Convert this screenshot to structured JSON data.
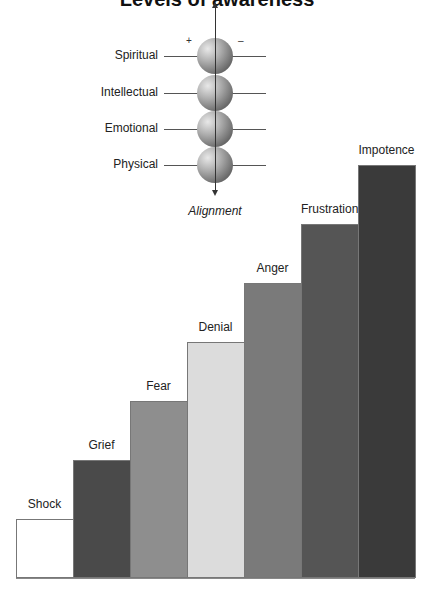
{
  "title": "Levels of awareness",
  "diagram": {
    "plus_sign": "+",
    "minus_sign": "–",
    "axis_label": "Alignment",
    "levels": [
      {
        "label": "Spiritual",
        "y": 56
      },
      {
        "label": "Intellectual",
        "y": 93
      },
      {
        "label": "Emotional",
        "y": 129
      },
      {
        "label": "Physical",
        "y": 165
      }
    ]
  },
  "chart_data": {
    "type": "bar",
    "title": "",
    "categories": [
      "Shock",
      "Grief",
      "Fear",
      "Denial",
      "Anger",
      "Frustration",
      "Impotence"
    ],
    "values": [
      1,
      2,
      3,
      4,
      5,
      6,
      7
    ],
    "colors": [
      "#ffffff",
      "#4a4a4a",
      "#8e8e8e",
      "#dcdcdc",
      "#7a7a7a",
      "#555555",
      "#3a3a3a"
    ],
    "xlabel": "",
    "ylabel": "",
    "grid": false,
    "legend": "none",
    "ylim": [
      0,
      7
    ],
    "note": "Staircase of equal increments; no axis ticks shown"
  }
}
